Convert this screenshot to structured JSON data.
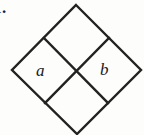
{
  "figure": {
    "label": "1.",
    "background_color": "#fdfdfb",
    "stroke_color": "#222222",
    "stroke_width": 2.4,
    "cell_labels": {
      "left": "a",
      "right": "b"
    },
    "shape": {
      "name": "subdivided-diamond",
      "description": "Large diamond (square rotated 45 degrees) subdivided into four congruent smaller diamonds by two internal segments joining midpoints of opposite sides",
      "outer_vertices": [
        {
          "name": "top",
          "x": 76,
          "y": 5
        },
        {
          "name": "right",
          "x": 141,
          "y": 70
        },
        {
          "name": "bottom",
          "x": 77,
          "y": 134
        },
        {
          "name": "left",
          "x": 12,
          "y": 70
        }
      ],
      "edge_midpoints": [
        {
          "name": "upper-left",
          "x": 44,
          "y": 38
        },
        {
          "name": "upper-right",
          "x": 109,
          "y": 38
        },
        {
          "name": "lower-right",
          "x": 108,
          "y": 103
        },
        {
          "name": "lower-left",
          "x": 45,
          "y": 103
        }
      ],
      "internal_segments": [
        {
          "name": "upper-left-to-lower-right",
          "x1": 44,
          "y1": 38,
          "x2": 108,
          "y2": 103
        },
        {
          "name": "upper-right-to-lower-left",
          "x1": 109,
          "y1": 38,
          "x2": 45,
          "y2": 103
        }
      ],
      "center": {
        "x": 77,
        "y": 71
      }
    }
  }
}
